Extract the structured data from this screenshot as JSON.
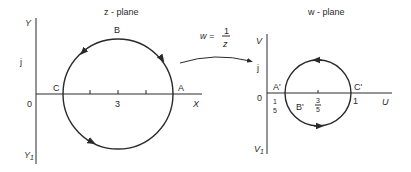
{
  "z_plane": {
    "title": "z - plane",
    "axis_y_top": "Y",
    "axis_y_bottom": "Y",
    "axis_y_bottom_sub": "1",
    "axis_x": "X",
    "origin": "0",
    "j_label": "j",
    "center_tick": "3",
    "points": {
      "A": "A",
      "B": "B",
      "C": "C"
    }
  },
  "mapping": {
    "lhs": "w =",
    "numerator": "1",
    "denominator": "z"
  },
  "w_plane": {
    "title": "w - plane",
    "axis_v_top": "V",
    "axis_v_bottom": "V",
    "axis_v_bottom_sub": "1",
    "axis_u": "U",
    "origin": "0",
    "j_label": "j",
    "one_label": "1",
    "left_frac_num": "1",
    "left_frac_den": "5",
    "center_frac_num": "3",
    "center_frac_den": "5",
    "points": {
      "A": "A'",
      "B": "B'",
      "C": "C'"
    }
  },
  "colors": {
    "ink": "#2a2a2a",
    "background": "#ffffff"
  }
}
